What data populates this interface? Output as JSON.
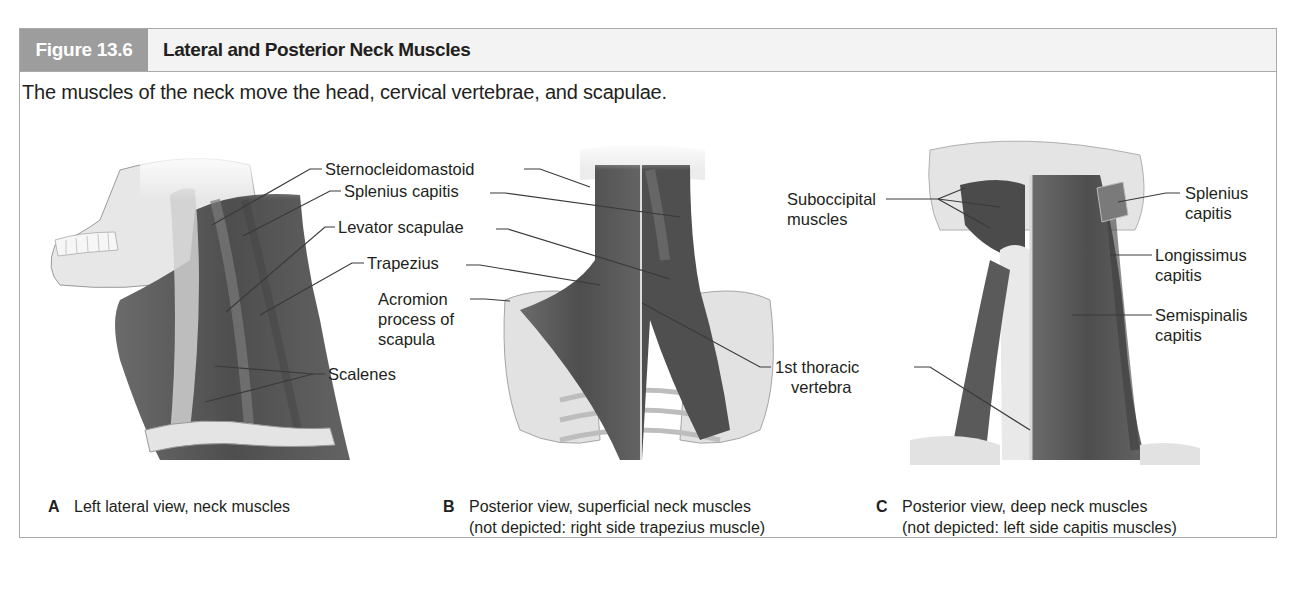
{
  "figure": {
    "number": "Figure 13.6",
    "title": "Lateral and Posterior Neck Muscles",
    "caption": "The muscles of the neck move the head, cervical vertebrae, and scapulae."
  },
  "colors": {
    "badge_bg": "#9d9d9d",
    "header_bg": "#f3f3f3",
    "border": "#a9a9a9",
    "muscle": "#5a5a5a",
    "bone": "#e6e6e6",
    "leader": "#3a3a3a"
  },
  "panels": [
    {
      "letter": "A",
      "subtitle_line1": "Left lateral view, neck muscles",
      "subtitle_line2": "",
      "labels": [
        "Sternocleidomastoid",
        "Splenius capitis",
        "Levator scapulae",
        "Trapezius",
        "Scalenes"
      ]
    },
    {
      "letter": "B",
      "subtitle_line1": "Posterior view, superficial neck muscles",
      "subtitle_line2": "(not depicted: right side trapezius muscle)",
      "labels": [
        "Acromion",
        "process of",
        "scapula",
        "1st thoracic",
        "vertebra"
      ]
    },
    {
      "letter": "C",
      "subtitle_line1": "Posterior view, deep neck muscles",
      "subtitle_line2": "(not depicted: left side capitis muscles)",
      "labels": [
        "Suboccipital",
        "muscles",
        "Splenius",
        "capitis",
        "Longissimus",
        "capitis",
        "Semispinalis",
        "capitis"
      ]
    }
  ]
}
